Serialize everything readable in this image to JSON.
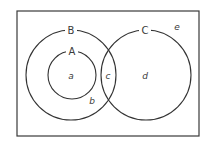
{
  "diagram": {
    "type": "venn",
    "universe": {
      "x": 17,
      "y": 11,
      "width": 182,
      "height": 125,
      "region_label": "e"
    },
    "sets": [
      {
        "name": "B",
        "cx": 71,
        "cy": 75,
        "r": 45,
        "label": "B",
        "contains": [
          "A"
        ]
      },
      {
        "name": "A",
        "cx": 72,
        "cy": 75,
        "r": 24,
        "label": "A"
      },
      {
        "name": "C",
        "cx": 146,
        "cy": 75,
        "r": 45,
        "label": "C"
      }
    ],
    "regions": {
      "a": "a",
      "b": "b",
      "c": "c",
      "d": "d",
      "e": "e"
    },
    "colors": {
      "stroke": "#333333",
      "text": "#3a3a3a",
      "background": "#ffffff"
    }
  }
}
